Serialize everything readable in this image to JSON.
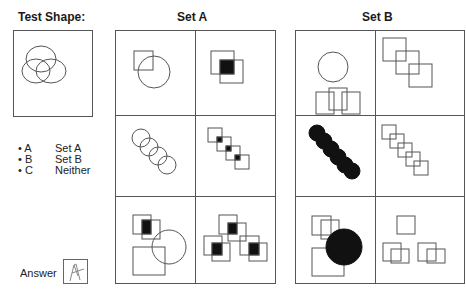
{
  "test_shape": {
    "title": "Test Shape:",
    "icon": "three-overlapping-circles"
  },
  "options": [
    {
      "letter": "A",
      "label": "Set A"
    },
    {
      "letter": "B",
      "label": "Set B"
    },
    {
      "letter": "C",
      "label": "Neither"
    }
  ],
  "answer": {
    "label": "Answer",
    "value": "A"
  },
  "set_a": {
    "title": "Set A",
    "cells": [
      "square-overlapping-circle",
      "two-squares-filled-overlap",
      "four-chained-circles",
      "four-chained-squares-filled-overlaps",
      "filled-square-pair-with-square-and-circle",
      "three-square-pairs-filled-overlaps"
    ]
  },
  "set_b": {
    "title": "Set B",
    "cells": [
      "circle-above-three-overlapping-squares",
      "three-chained-squares",
      "five-chained-filled-circles",
      "five-chained-squares",
      "two-squares-square-and-filled-circle",
      "square-and-square-pairs"
    ]
  },
  "colors": {
    "line": "#555555",
    "fill": "#111111",
    "text": "#222222"
  }
}
